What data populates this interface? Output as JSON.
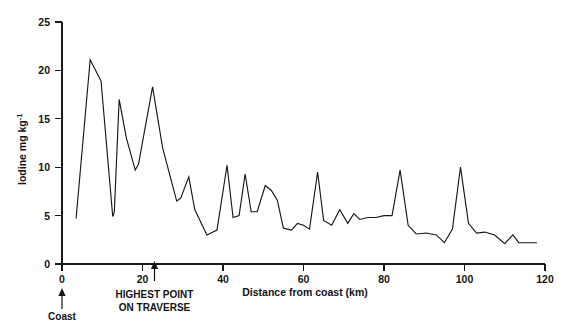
{
  "chart_data": {
    "type": "line",
    "title": "",
    "subtitle": "",
    "xlabel": "Distance from coast (km)",
    "ylabel": "Iodine mg kg-1",
    "ylabel_base": "Iodine mg kg",
    "ylabel_exponent": "-1",
    "xlim": [
      0,
      120
    ],
    "ylim": [
      0,
      25
    ],
    "xticks": [
      0,
      20,
      40,
      60,
      80,
      100,
      120
    ],
    "xtick_labels": [
      "0",
      "20",
      "40",
      "60",
      "80",
      "100",
      "120"
    ],
    "yticks": [
      0,
      5,
      10,
      15,
      20,
      25
    ],
    "ytick_labels": [
      "0",
      "5",
      "10",
      "15",
      "20",
      "25"
    ],
    "grid": false,
    "legend": "none",
    "series": [
      {
        "name": "Iodine concentration",
        "color": "#171717",
        "x": [
          3.5,
          7.0,
          9.7,
          12.6,
          13.0,
          14.2,
          16.0,
          18.2,
          19.0,
          22.5,
          25.0,
          28.5,
          29.5,
          31.5,
          33.0,
          36.0,
          38.5,
          41.0,
          42.5,
          44.0,
          45.5,
          47.0,
          48.5,
          50.5,
          52.0,
          53.5,
          55.0,
          57.0,
          58.5,
          60.0,
          61.5,
          63.5,
          65.0,
          67.0,
          69.0,
          71.0,
          72.5,
          74.0,
          76.0,
          78.0,
          80.0,
          82.0,
          84.0,
          86.0,
          88.0,
          90.5,
          93.0,
          95.0,
          97.0,
          99.0,
          101.0,
          103.0,
          105.0,
          107.5,
          110.0,
          112.0,
          113.5,
          118.0
        ],
        "y": [
          4.7,
          21.1,
          18.9,
          4.9,
          5.4,
          17.0,
          13.0,
          9.7,
          10.3,
          18.3,
          12.0,
          6.5,
          6.8,
          9.0,
          5.6,
          3.0,
          3.5,
          10.2,
          4.8,
          5.0,
          9.3,
          5.4,
          5.4,
          8.1,
          7.6,
          6.6,
          3.7,
          3.5,
          4.2,
          4.0,
          3.6,
          9.5,
          4.5,
          4.0,
          5.6,
          4.2,
          5.2,
          4.6,
          4.8,
          4.8,
          5.0,
          5.0,
          9.7,
          4.0,
          3.1,
          3.2,
          3.0,
          2.2,
          3.6,
          10.0,
          4.2,
          3.2,
          3.3,
          3.0,
          2.1,
          3.0,
          2.2,
          2.2
        ]
      }
    ],
    "annotations": [
      {
        "id": "coast",
        "label_lines": [
          "Coast"
        ],
        "x_value": 0,
        "arrow": "up"
      },
      {
        "id": "highest-point-on-traverse",
        "label_lines": [
          "HIGHEST POINT",
          "ON TRAVERSE"
        ],
        "x_value": 23,
        "arrow": "up"
      }
    ]
  }
}
